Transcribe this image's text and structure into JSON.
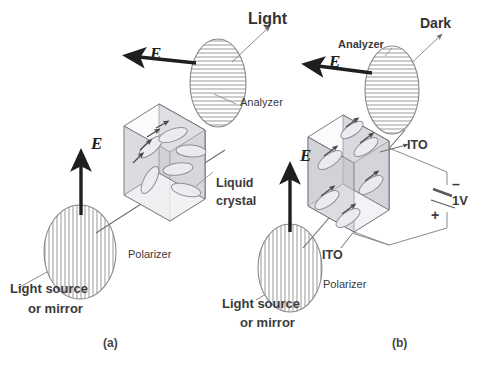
{
  "figure": {
    "background": "#ffffff",
    "ink": "#3a3a3a"
  },
  "panels": [
    {
      "id": "a",
      "caption": "(a)",
      "state": "voltage off",
      "output_label": "Light",
      "analyzer_label": "Analyzer",
      "polarizer_label": "Polarizer",
      "source_label_line1": "Light source",
      "source_label_line2": "or mirror",
      "cell_label_line1": "Liquid",
      "cell_label_line2": "crystal",
      "e_in_label": "E",
      "e_out_label": "E"
    },
    {
      "id": "b",
      "caption": "(b)",
      "state": "1V applied",
      "output_label": "Dark",
      "analyzer_label": "Analyzer",
      "polarizer_label": "Polarizer",
      "source_label_line1": "Light source",
      "source_label_line2": "or mirror",
      "electrode_label_top": "ITO",
      "electrode_label_bottom": "ITO",
      "voltage_label": "1V",
      "terminal_negative": "–",
      "terminal_positive": "+",
      "e_in_label": "E",
      "e_out_label": "E"
    }
  ],
  "icons": {
    "polarizer": "vertical-hatched-ellipse",
    "analyzer": "horizontal-hatched-ellipse",
    "field_arrow": "bold-arrow",
    "ray": "thin-arrow",
    "battery": "battery-cell-symbol"
  }
}
